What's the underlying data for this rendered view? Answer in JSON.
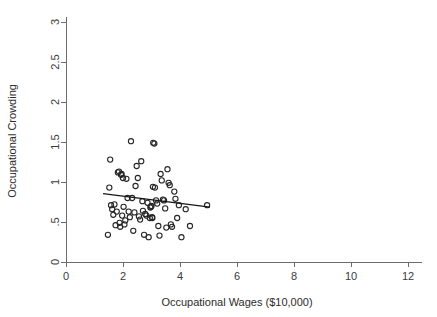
{
  "chart_data": {
    "type": "scatter",
    "title": "",
    "xlabel": "Occupational Wages ($10,000)",
    "ylabel": "Occupational Crowding",
    "xlim": [
      0,
      12
    ],
    "ylim": [
      0,
      3
    ],
    "xticks": [
      0,
      2,
      4,
      6,
      8,
      10,
      12
    ],
    "xtick_labels": [
      "0",
      "2",
      "4",
      "6",
      "8",
      "10",
      "12"
    ],
    "yticks": [
      0,
      0.5,
      1,
      1.5,
      2,
      2.5,
      3
    ],
    "ytick_labels": [
      "0",
      ".5",
      "1",
      "1.5",
      "2",
      "2.5",
      "3"
    ],
    "grid": false,
    "legend": false,
    "marker": "open-circle",
    "marker_color": "#262626",
    "fit_line_color": "#161616",
    "series": [
      {
        "name": "Occupations",
        "points": [
          [
            1.47,
            0.34
          ],
          [
            1.52,
            0.93
          ],
          [
            1.55,
            1.28
          ],
          [
            1.58,
            0.71
          ],
          [
            1.62,
            0.66
          ],
          [
            1.66,
            0.59
          ],
          [
            1.7,
            0.72
          ],
          [
            1.74,
            0.46
          ],
          [
            1.78,
            0.63
          ],
          [
            1.82,
            1.12
          ],
          [
            1.86,
            1.13
          ],
          [
            1.88,
            0.49
          ],
          [
            1.9,
            0.44
          ],
          [
            1.93,
            1.09
          ],
          [
            1.95,
            1.1
          ],
          [
            1.97,
            0.58
          ],
          [
            2.0,
            1.05
          ],
          [
            2.02,
            0.69
          ],
          [
            2.05,
            0.47
          ],
          [
            2.08,
            0.52
          ],
          [
            2.12,
            1.04
          ],
          [
            2.16,
            0.8
          ],
          [
            2.2,
            0.63
          ],
          [
            2.24,
            0.56
          ],
          [
            2.28,
            1.51
          ],
          [
            2.32,
            0.8
          ],
          [
            2.36,
            0.39
          ],
          [
            2.4,
            0.62
          ],
          [
            2.44,
            0.95
          ],
          [
            2.48,
            1.2
          ],
          [
            2.52,
            1.05
          ],
          [
            2.56,
            0.57
          ],
          [
            2.6,
            0.53
          ],
          [
            2.64,
            1.26
          ],
          [
            2.68,
            0.76
          ],
          [
            2.7,
            0.64
          ],
          [
            2.74,
            0.34
          ],
          [
            2.78,
            0.6
          ],
          [
            2.82,
            0.58
          ],
          [
            2.86,
            0.74
          ],
          [
            2.9,
            0.31
          ],
          [
            2.94,
            0.55
          ],
          [
            2.96,
            0.68
          ],
          [
            2.98,
            0.69
          ],
          [
            3.0,
            0.7
          ],
          [
            3.02,
            0.56
          ],
          [
            3.03,
            0.55
          ],
          [
            3.05,
            0.94
          ],
          [
            3.06,
            1.49
          ],
          [
            3.1,
            1.48
          ],
          [
            3.12,
            0.93
          ],
          [
            3.16,
            0.77
          ],
          [
            3.2,
            0.73
          ],
          [
            3.24,
            0.45
          ],
          [
            3.28,
            0.33
          ],
          [
            3.32,
            1.1
          ],
          [
            3.36,
            1.02
          ],
          [
            3.4,
            0.78
          ],
          [
            3.44,
            0.77
          ],
          [
            3.48,
            0.67
          ],
          [
            3.52,
            0.43
          ],
          [
            3.56,
            1.16
          ],
          [
            3.6,
            0.99
          ],
          [
            3.64,
            0.96
          ],
          [
            3.68,
            0.47
          ],
          [
            3.72,
            0.44
          ],
          [
            3.8,
            0.88
          ],
          [
            3.84,
            0.79
          ],
          [
            3.9,
            0.55
          ],
          [
            3.96,
            0.71
          ],
          [
            4.05,
            0.31
          ],
          [
            4.2,
            0.66
          ],
          [
            4.35,
            0.45
          ],
          [
            4.95,
            0.71
          ]
        ]
      }
    ],
    "fit_line": {
      "name": "linear fit",
      "x_start": 1.3,
      "y_start": 0.855,
      "x_end": 5.05,
      "y_end": 0.685
    }
  }
}
